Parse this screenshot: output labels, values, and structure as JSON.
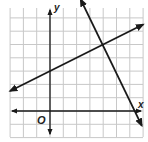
{
  "chart_data": {
    "type": "line",
    "title": "",
    "xlabel": "x",
    "ylabel": "y",
    "origin_label": "O",
    "grid": true,
    "xlim": [
      -3,
      7
    ],
    "ylim": [
      -2,
      8
    ],
    "grid_step": 1,
    "tick_labels_shown": false,
    "series": [
      {
        "name": "line-1",
        "equation": "y = 0.5x + 3",
        "slope": 0.5,
        "intercept": 3,
        "points": [
          [
            -3,
            1.5
          ],
          [
            0,
            3
          ],
          [
            4,
            5
          ],
          [
            7,
            6.5
          ]
        ],
        "arrows": "both"
      },
      {
        "name": "line-2",
        "equation": "y = -2x + 13",
        "slope": -2,
        "intercept": 13,
        "points": [
          [
            2.3,
            8.4
          ],
          [
            4,
            5
          ],
          [
            6.5,
            0
          ],
          [
            6.9,
            -1.1
          ]
        ],
        "arrows": "both"
      }
    ],
    "intersection": [
      4,
      5
    ],
    "colors": {
      "lines": "#1a1a1a",
      "grid": "#c8c8c8",
      "axes": "#1a1a1a"
    }
  },
  "labels": {
    "x_axis": "x",
    "y_axis": "y",
    "origin": "O"
  }
}
